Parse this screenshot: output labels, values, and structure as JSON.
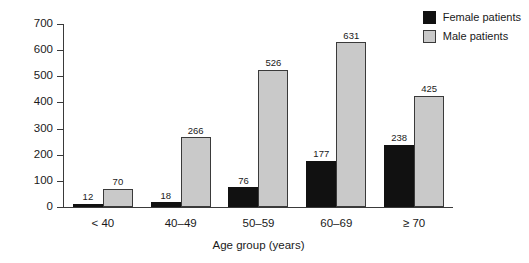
{
  "chart_data": {
    "type": "bar",
    "title": "",
    "xlabel": "Age group (years)",
    "ylabel": "",
    "ylim": [
      0,
      700
    ],
    "yticks": [
      0,
      100,
      200,
      300,
      400,
      500,
      600,
      700
    ],
    "ytick_labels": [
      "0",
      "100",
      "200",
      "300",
      "400",
      "500",
      "600",
      "700"
    ],
    "grid": false,
    "legend_position": "top-right",
    "categories": [
      "< 40",
      "40–49",
      "50–59",
      "60–69",
      "≥ 70"
    ],
    "series": [
      {
        "name": "Female patients",
        "color": "#111111",
        "values": [
          12,
          18,
          76,
          177,
          238
        ],
        "value_labels": [
          "12",
          "18",
          "76",
          "177",
          "238"
        ]
      },
      {
        "name": "Male patients",
        "color": "#c9c9c9",
        "values": [
          70,
          266,
          526,
          631,
          425
        ],
        "value_labels": [
          "70",
          "266",
          "526",
          "631",
          "425"
        ]
      }
    ]
  },
  "legend": {
    "items": [
      {
        "label": "Female patients",
        "swatch": "#111111"
      },
      {
        "label": "Male patients",
        "swatch": "#c9c9c9"
      }
    ]
  }
}
